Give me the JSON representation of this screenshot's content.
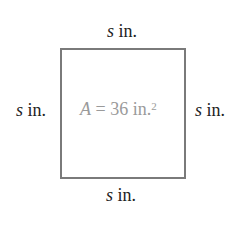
{
  "diagram": {
    "shape": "square",
    "side_labels": {
      "top": {
        "var": "s",
        "unit": " in."
      },
      "left": {
        "var": "s",
        "unit": " in."
      },
      "right": {
        "var": "s",
        "unit": " in."
      },
      "bottom": {
        "var": "s",
        "unit": " in."
      }
    },
    "area_label": {
      "var": "A",
      "eq": " = 36 in.",
      "exp": "2"
    },
    "colors": {
      "border": "#7a7a7a",
      "area_text": "#9a9a9a",
      "label_text": "#222222"
    }
  }
}
